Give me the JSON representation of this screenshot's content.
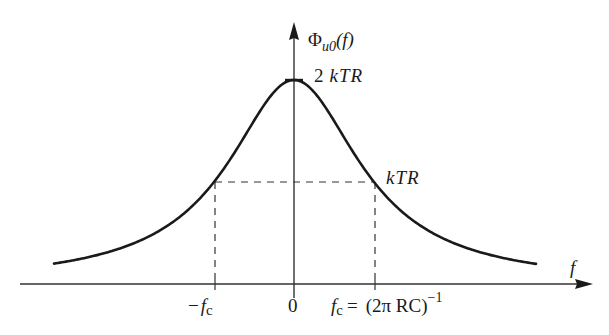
{
  "diagram": {
    "y_axis_label": {
      "symbol": "Φ",
      "subscript": "u0",
      "arg": "(f)"
    },
    "x_axis_label": "f",
    "peak_label": {
      "num": "2",
      "text": "kTR"
    },
    "half_label": "kTR",
    "x_ticks": {
      "neg_fc": {
        "sign": "−",
        "f": "f",
        "sub": "c"
      },
      "zero": "0",
      "pos_fc": {
        "f": "f",
        "sub": "c",
        "eq": "=",
        "expr": "(2π RC)",
        "exp": "−1"
      }
    },
    "colors": {
      "curve": "#1a1a1a",
      "axes": "#333333",
      "background": "#ffffff"
    }
  },
  "chart_data": {
    "type": "line",
    "xlabel": "f",
    "ylabel": "Φ_u0(f)",
    "x_ticks": [
      "-f_c",
      "0",
      "f_c = (2πRC)^-1"
    ],
    "y_marks": [
      "2kTR",
      "kTR"
    ],
    "x": [
      -3.3,
      -2,
      -1,
      0,
      1,
      2,
      3.3
    ],
    "values": [
      0.168,
      0.4,
      1.0,
      2.0,
      1.0,
      0.4,
      0.168
    ],
    "units_y": "kTR",
    "grid": false,
    "annotations": [
      "dashed lines at f = ±f_c to level kTR"
    ]
  }
}
